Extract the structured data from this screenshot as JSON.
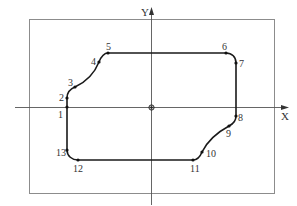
{
  "diagram": {
    "type": "cnc-contour-toolpath",
    "axes": {
      "x_label": "X",
      "y_label": "Y",
      "origin_marker": "workpiece-origin"
    },
    "contour_points": [
      {
        "id": "1",
        "label": "1"
      },
      {
        "id": "2",
        "label": "2"
      },
      {
        "id": "3",
        "label": "3"
      },
      {
        "id": "4",
        "label": "4"
      },
      {
        "id": "5",
        "label": "5"
      },
      {
        "id": "6",
        "label": "6"
      },
      {
        "id": "7",
        "label": "7"
      },
      {
        "id": "8",
        "label": "8"
      },
      {
        "id": "9",
        "label": "9"
      },
      {
        "id": "10",
        "label": "10"
      },
      {
        "id": "11",
        "label": "11"
      },
      {
        "id": "12",
        "label": "12"
      },
      {
        "id": "13",
        "label": "13"
      }
    ],
    "segments": [
      {
        "from": "1",
        "to": "2",
        "kind": "line"
      },
      {
        "from": "2",
        "to": "3",
        "kind": "arc"
      },
      {
        "from": "3",
        "to": "4",
        "kind": "arc"
      },
      {
        "from": "4",
        "to": "5",
        "kind": "arc"
      },
      {
        "from": "5",
        "to": "6",
        "kind": "line"
      },
      {
        "from": "6",
        "to": "7",
        "kind": "arc"
      },
      {
        "from": "7",
        "to": "8",
        "kind": "line"
      },
      {
        "from": "8",
        "to": "9",
        "kind": "arc"
      },
      {
        "from": "9",
        "to": "10",
        "kind": "arc"
      },
      {
        "from": "10",
        "to": "11",
        "kind": "arc"
      },
      {
        "from": "11",
        "to": "12",
        "kind": "line"
      },
      {
        "from": "12",
        "to": "13",
        "kind": "arc"
      },
      {
        "from": "13",
        "to": "1",
        "kind": "line"
      }
    ],
    "icons": {
      "origin": "origin-dot-icon",
      "x_arrow": "arrow-right-icon",
      "y_arrow": "arrow-up-icon"
    }
  }
}
